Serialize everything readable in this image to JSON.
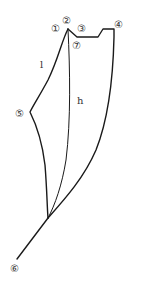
{
  "diagram": {
    "type": "pattern-outline",
    "stroke_color": "#1a1a1a",
    "point_labels": {
      "p1": "①",
      "p2": "②",
      "p3": "③",
      "p4": "④",
      "p5": "⑤",
      "p6": "⑥",
      "p7": "⑦"
    },
    "line_labels": {
      "left": "l",
      "center": "h"
    }
  }
}
